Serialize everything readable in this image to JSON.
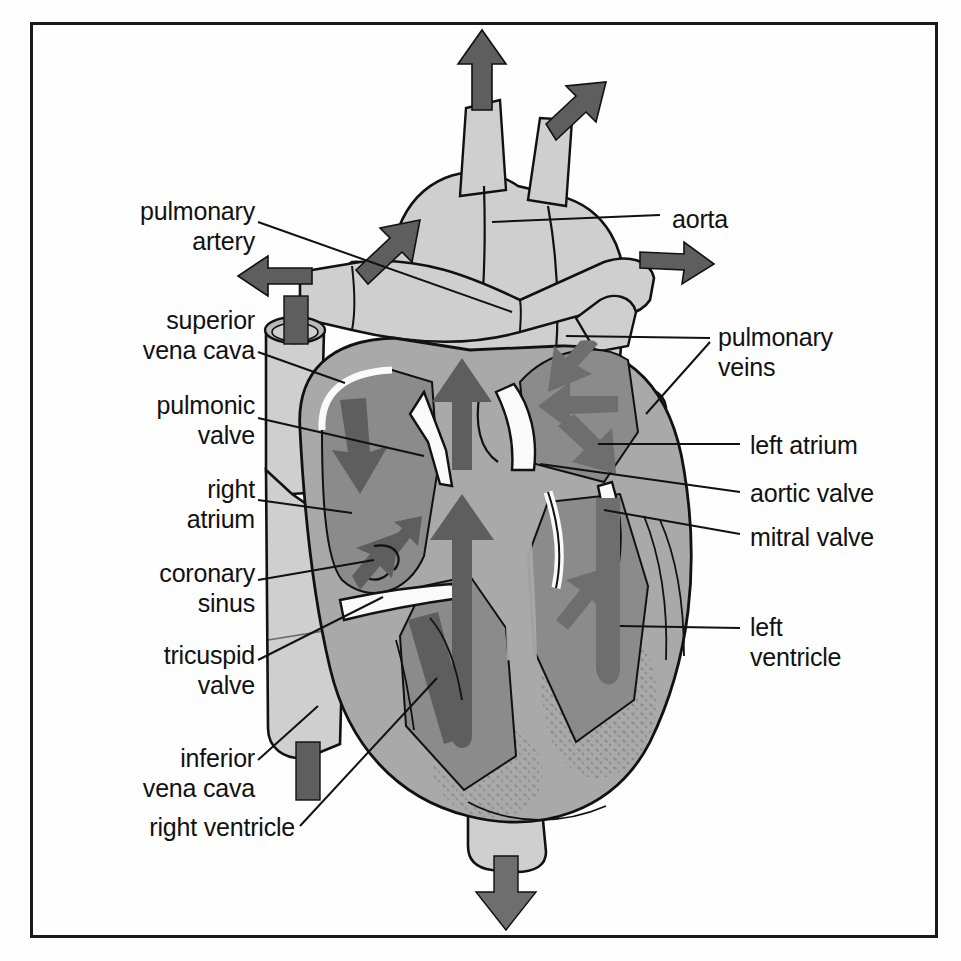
{
  "figure": {
    "border_color": "#1a1a1a",
    "background_color": "#fefefe"
  },
  "palette": {
    "vessel_light": "#cfcfcf",
    "myocardium": "#a9a9a9",
    "chamber_dark": "#8b8b8b",
    "arrow_dark": "#5e5e5e",
    "arrow_mid": "#6e6e6e",
    "valve_white": "#fafafa",
    "outline": "#111111",
    "text": "#111111"
  },
  "labels": {
    "left": [
      {
        "id": "pulmonary-artery",
        "text": "pulmonary\nartery",
        "x": 60,
        "y": 196,
        "align": "right",
        "width": 195
      },
      {
        "id": "superior-vena-cava",
        "text": "superior\nvena cava",
        "x": 42,
        "y": 305,
        "align": "right",
        "width": 213
      },
      {
        "id": "pulmonic-valve",
        "text": "pulmonic\nvalve",
        "x": 60,
        "y": 390,
        "align": "right",
        "width": 195
      },
      {
        "id": "right-atrium",
        "text": "right\natrium",
        "x": 80,
        "y": 474,
        "align": "right",
        "width": 175
      },
      {
        "id": "coronary-sinus",
        "text": "coronary\nsinus",
        "x": 60,
        "y": 558,
        "align": "right",
        "width": 195
      },
      {
        "id": "tricuspid-valve",
        "text": "tricuspid\nvalve",
        "x": 60,
        "y": 640,
        "align": "right",
        "width": 195
      },
      {
        "id": "inferior-vena-cava",
        "text": "inferior\nvena cava",
        "x": 50,
        "y": 743,
        "align": "right",
        "width": 205
      },
      {
        "id": "right-ventricle",
        "text": "right ventricle",
        "x": 35,
        "y": 818,
        "align": "right",
        "width": 260
      }
    ],
    "right": [
      {
        "id": "aorta",
        "text": "aorta",
        "x": 672,
        "y": 205,
        "align": "left",
        "width": 230
      },
      {
        "id": "pulmonary-veins",
        "text": "pulmonary\nveins",
        "x": 718,
        "y": 330,
        "align": "left",
        "width": 230
      },
      {
        "id": "left-atrium",
        "text": "left atrium",
        "x": 750,
        "y": 432,
        "align": "left",
        "width": 210
      },
      {
        "id": "aortic-valve",
        "text": "aortic valve",
        "x": 750,
        "y": 480,
        "align": "left",
        "width": 210
      },
      {
        "id": "mitral-valve",
        "text": "mitral valve",
        "x": 750,
        "y": 524,
        "align": "left",
        "width": 210
      },
      {
        "id": "left-ventricle",
        "text": "left\nventricle",
        "x": 750,
        "y": 618,
        "align": "left",
        "width": 210
      }
    ]
  },
  "leaders": [
    {
      "id": "leader-pulmonary-artery",
      "points": "258,222 512,312"
    },
    {
      "id": "leader-superior-vena-cava",
      "points": "258,352 345,383"
    },
    {
      "id": "leader-pulmonic-valve",
      "points": "258,418 420,456"
    },
    {
      "id": "leader-right-atrium",
      "points": "258,500 352,513"
    },
    {
      "id": "leader-coronary-sinus",
      "points": "258,580 372,562"
    },
    {
      "id": "leader-tricuspid-valve",
      "points": "258,660 383,597"
    },
    {
      "id": "leader-inferior-vena-cava",
      "points": "258,760 318,708"
    },
    {
      "id": "leader-right-ventricle",
      "points": "300,828 435,680"
    },
    {
      "id": "leader-aorta",
      "points": "660,215 492,222"
    },
    {
      "id": "leader-pulmonary-veins-a",
      "points": "710,340 566,338"
    },
    {
      "id": "leader-pulmonary-veins-b",
      "points": "710,343 648,415"
    },
    {
      "id": "leader-left-atrium",
      "position": "740,446 600,446"
    },
    {
      "id": "leader-left-atrium-line",
      "points": "740,446 600,446"
    },
    {
      "id": "leader-aortic-valve",
      "points": "740,492 540,466"
    },
    {
      "id": "leader-mitral-valve",
      "points": "740,536 602,512"
    },
    {
      "id": "leader-left-ventricle",
      "points": "740,628 620,628"
    }
  ],
  "flow_arrows": [
    {
      "id": "arrow-aorta-branch-left",
      "direction": "up-left",
      "chamber": "aortic-arch-branch"
    },
    {
      "id": "arrow-aorta-branch-mid",
      "direction": "up",
      "chamber": "aortic-arch-branch"
    },
    {
      "id": "arrow-aorta-branch-right",
      "direction": "up-right",
      "chamber": "aortic-arch-branch"
    },
    {
      "id": "arrow-pulmonary-artery-out",
      "direction": "left",
      "chamber": "pulmonary-artery"
    },
    {
      "id": "arrow-aorta-out-right",
      "direction": "right",
      "chamber": "aorta"
    },
    {
      "id": "arrow-svc-in",
      "direction": "down",
      "chamber": "superior-vena-cava"
    },
    {
      "id": "arrow-ivc-in",
      "direction": "down",
      "chamber": "inferior-vena-cava"
    },
    {
      "id": "arrow-ra-down",
      "direction": "down-right",
      "chamber": "right-atrium"
    },
    {
      "id": "arrow-ra-up",
      "direction": "up-right",
      "chamber": "right-atrium"
    },
    {
      "id": "arrow-ra-small",
      "direction": "up-right",
      "chamber": "right-atrium"
    },
    {
      "id": "arrow-rv-out-up",
      "direction": "up",
      "chamber": "right-ventricle"
    },
    {
      "id": "arrow-rv-in-up",
      "direction": "up",
      "chamber": "right-ventricle"
    },
    {
      "id": "arrow-pv-in-upper",
      "direction": "down-left",
      "chamber": "left-atrium"
    },
    {
      "id": "arrow-pv-in-lower",
      "direction": "left",
      "chamber": "left-atrium"
    },
    {
      "id": "arrow-la-to-lv",
      "direction": "down-right",
      "chamber": "left-atrium"
    },
    {
      "id": "arrow-lv-out",
      "direction": "up-left",
      "chamber": "left-ventricle"
    },
    {
      "id": "arrow-lv-fill",
      "direction": "down",
      "chamber": "left-ventricle"
    },
    {
      "id": "arrow-descending-aorta",
      "direction": "down",
      "chamber": "descending-aorta"
    }
  ]
}
